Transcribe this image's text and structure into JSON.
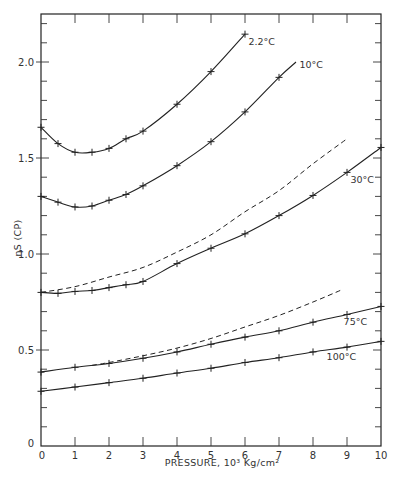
{
  "chart_data": {
    "type": "line",
    "title": "",
    "xlabel": "PRESSURE, 10³ Kg/cm²",
    "ylabel": "ηS (CP)",
    "xlim": [
      0,
      10
    ],
    "ylim": [
      0,
      2.25
    ],
    "grid": false,
    "x_ticks": [
      0,
      1,
      2,
      3,
      4,
      5,
      6,
      7,
      8,
      9,
      10
    ],
    "x_tick_labels": [
      "0",
      "1",
      "2",
      "3",
      "4",
      "5",
      "6",
      "7",
      "8",
      "9",
      "10"
    ],
    "y_ticks": [
      0,
      0.5,
      1.0,
      1.5,
      2.0
    ],
    "y_tick_labels": [
      "0",
      "0.5",
      "1.0",
      "1.5",
      "2.0"
    ],
    "y_minor_step": 0.1,
    "series": [
      {
        "name": "2.2°C",
        "label": "2.2°C",
        "style": "solid",
        "markers": true,
        "x": [
          0,
          0.5,
          1,
          1.5,
          2,
          2.5,
          3,
          4,
          5,
          6
        ],
        "y": [
          1.66,
          1.575,
          1.53,
          1.53,
          1.55,
          1.6,
          1.64,
          1.78,
          1.95,
          2.145
        ]
      },
      {
        "name": "10°C",
        "label": "10°C",
        "style": "solid",
        "markers": true,
        "x": [
          0,
          0.5,
          1,
          1.5,
          2,
          2.5,
          3,
          4,
          5,
          6,
          7,
          7.5
        ],
        "y": [
          1.3,
          1.27,
          1.245,
          1.25,
          1.28,
          1.31,
          1.355,
          1.46,
          1.585,
          1.74,
          1.92,
          2.0
        ],
        "marker_mask": [
          1,
          1,
          1,
          1,
          1,
          1,
          1,
          1,
          1,
          1,
          1,
          0
        ]
      },
      {
        "name": "30°C (dashed)",
        "label": "",
        "style": "dashed",
        "markers": false,
        "x": [
          0,
          1,
          2,
          3,
          4,
          5,
          6,
          7,
          8,
          9
        ],
        "y": [
          0.8,
          0.83,
          0.88,
          0.93,
          1.01,
          1.1,
          1.22,
          1.33,
          1.47,
          1.6
        ]
      },
      {
        "name": "30°C",
        "label": "30°C",
        "style": "solid",
        "markers": true,
        "x": [
          0,
          0.5,
          1,
          1.5,
          2,
          2.5,
          3,
          4,
          5,
          6,
          7,
          8,
          9,
          10
        ],
        "y": [
          0.8,
          0.795,
          0.805,
          0.81,
          0.825,
          0.84,
          0.857,
          0.95,
          1.03,
          1.105,
          1.2,
          1.305,
          1.425,
          1.555
        ]
      },
      {
        "name": "75°C (dashed)",
        "label": "",
        "style": "dashed",
        "markers": false,
        "x": [
          1.5,
          2,
          3,
          4,
          5,
          6,
          7,
          8,
          8.8
        ],
        "y": [
          0.42,
          0.435,
          0.47,
          0.51,
          0.56,
          0.62,
          0.68,
          0.75,
          0.81
        ]
      },
      {
        "name": "75°C",
        "label": "75°C",
        "style": "solid",
        "markers": true,
        "x": [
          0,
          1,
          2,
          3,
          4,
          5,
          6,
          7,
          8,
          9,
          10
        ],
        "y": [
          0.385,
          0.41,
          0.43,
          0.457,
          0.49,
          0.53,
          0.567,
          0.6,
          0.645,
          0.685,
          0.727
        ]
      },
      {
        "name": "100°C",
        "label": "100°C",
        "style": "solid",
        "markers": true,
        "x": [
          0,
          1,
          2,
          3,
          4,
          5,
          6,
          7,
          8,
          9,
          10
        ],
        "y": [
          0.285,
          0.307,
          0.33,
          0.353,
          0.38,
          0.405,
          0.435,
          0.46,
          0.49,
          0.515,
          0.545
        ]
      }
    ],
    "annotations": [
      {
        "text": "2.2°C",
        "series": "2.2°C",
        "near_x": 6.1,
        "near_y": 2.09
      },
      {
        "text": "10°C",
        "series": "10°C",
        "near_x": 7.6,
        "near_y": 1.97
      },
      {
        "text": "30°C",
        "series": "30°C",
        "near_x": 9.1,
        "near_y": 1.37
      },
      {
        "text": "75°C",
        "series": "75°C",
        "near_x": 8.9,
        "near_y": 0.63
      },
      {
        "text": "100°C",
        "series": "100°C",
        "near_x": 8.4,
        "near_y": 0.45
      }
    ]
  }
}
